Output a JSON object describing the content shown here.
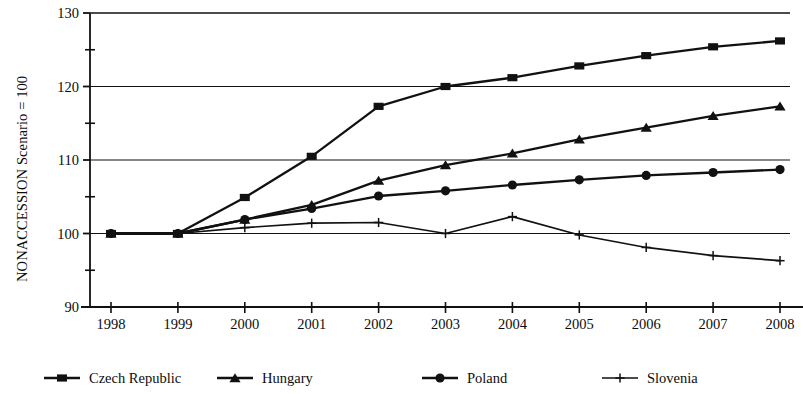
{
  "chart_data": {
    "type": "line",
    "title": "",
    "subtitle": "",
    "xlabel": "",
    "ylabel": "NONACCESSION Scenario = 100",
    "x": [
      "1998",
      "1999",
      "2000",
      "2001",
      "2002",
      "2003",
      "2004",
      "2005",
      "2006",
      "2007",
      "2008"
    ],
    "categories": [
      "1998",
      "1999",
      "2000",
      "2001",
      "2002",
      "2003",
      "2004",
      "2005",
      "2006",
      "2007",
      "2008"
    ],
    "xlim": [
      1998,
      2008
    ],
    "ylim": [
      90,
      130
    ],
    "yticks": [
      90,
      100,
      110,
      120,
      130
    ],
    "yticklabels": [
      "90",
      "100",
      "110",
      "120",
      "130"
    ],
    "yminorticks": [
      95,
      105,
      115,
      125
    ],
    "grid": "horizontal-major",
    "legend_position": "bottom",
    "series": [
      {
        "name": "Czech Republic",
        "marker": "square",
        "color": "#111111",
        "values": [
          100.0,
          100.0,
          104.9,
          110.5,
          117.3,
          120.0,
          121.2,
          122.8,
          124.2,
          125.4,
          126.2
        ]
      },
      {
        "name": "Hungary",
        "marker": "triangle",
        "color": "#111111",
        "values": [
          100.0,
          100.0,
          101.9,
          103.9,
          107.2,
          109.3,
          110.9,
          112.8,
          114.4,
          116.0,
          117.3
        ]
      },
      {
        "name": "Poland",
        "marker": "circle",
        "color": "#111111",
        "values": [
          100.0,
          100.0,
          101.9,
          103.4,
          105.1,
          105.8,
          106.6,
          107.3,
          107.9,
          108.3,
          108.7
        ]
      },
      {
        "name": "Slovenia",
        "marker": "plus",
        "color": "#111111",
        "values": [
          100.0,
          100.0,
          100.8,
          101.4,
          101.5,
          100.0,
          102.3,
          99.8,
          98.1,
          97.0,
          96.3
        ]
      }
    ]
  },
  "legend": {
    "items": [
      {
        "label": "Czech Republic",
        "marker": "square"
      },
      {
        "label": "Hungary",
        "marker": "triangle"
      },
      {
        "label": "Poland",
        "marker": "circle"
      },
      {
        "label": "Slovenia",
        "marker": "plus"
      }
    ]
  }
}
